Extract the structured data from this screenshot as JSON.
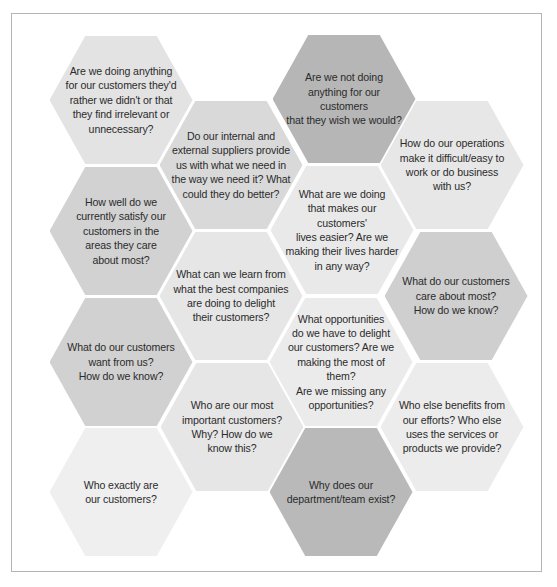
{
  "diagram": {
    "type": "hexagon-grid",
    "hexagons": [
      {
        "id": "h1",
        "text": "Are we doing anything\nfor our customers they'd\nrather we didn't or that\nthey find irrelevant or\nunnecessary?",
        "fill": "#e3e3e3",
        "cx": 121,
        "cy": 100
      },
      {
        "id": "h2",
        "text": "Are we not doing\nanything for our customers\nthat they wish we would?",
        "fill": "#b6b6b6",
        "cx": 344,
        "cy": 99
      },
      {
        "id": "h3",
        "text": "Do our internal and\nexternal suppliers provide\nus with what we need in\nthe way we need it? What\ncould they do better?",
        "fill": "#d9d9d9",
        "cx": 231,
        "cy": 165
      },
      {
        "id": "h4",
        "text": "How do our operations\nmake it difficult/easy to\nwork or do business\nwith us?",
        "fill": "#e7e7e7",
        "cx": 452,
        "cy": 165
      },
      {
        "id": "h5",
        "text": "How well do we\ncurrently satisfy our\ncustomers in the\nareas they care\nabout most?",
        "fill": "#d2d2d2",
        "cx": 121,
        "cy": 231
      },
      {
        "id": "h6",
        "text": "What are we doing\nthat makes our customers'\nlives easier? Are we\nmaking their lives harder\nin any way?",
        "fill": "#e9e9e9",
        "cx": 342,
        "cy": 230
      },
      {
        "id": "h7",
        "text": "What can we learn from\nwhat the best companies\nare doing to delight\ntheir customers?",
        "fill": "#e6e6e6",
        "cx": 231,
        "cy": 296
      },
      {
        "id": "h8",
        "text": "What do our customers\ncare about most?\nHow do we know?",
        "fill": "#cfcfcf",
        "cx": 456,
        "cy": 296
      },
      {
        "id": "h9",
        "text": "What do our customers\nwant from us?\nHow do we know?",
        "fill": "#d1d1d1",
        "cx": 121,
        "cy": 362
      },
      {
        "id": "h10",
        "text": "What opportunities\ndo we have to delight\nour customers? Are we\nmaking the most of them?\nAre we missing any\nopportunities?",
        "fill": "#ebebeb",
        "cx": 341,
        "cy": 362
      },
      {
        "id": "h11",
        "text": "Who are our most\nimportant customers?\nWhy? How do we\nknow this?",
        "fill": "#e6e6e6",
        "cx": 232,
        "cy": 427
      },
      {
        "id": "h12",
        "text": "Who else benefits from\nour efforts? Who else\nuses the services or\nproducts we provide?",
        "fill": "#ececec",
        "cx": 452,
        "cy": 427
      },
      {
        "id": "h13",
        "text": "Who exactly are\nour customers?",
        "fill": "#efefef",
        "cx": 121,
        "cy": 492
      },
      {
        "id": "h14",
        "text": "Why does our\ndepartment/team exist?",
        "fill": "#b9b9b9",
        "cx": 341,
        "cy": 492
      }
    ]
  },
  "colors": {
    "frame_border": "#b4b4b4",
    "text": "#2b2b2b",
    "background": "#ffffff"
  }
}
